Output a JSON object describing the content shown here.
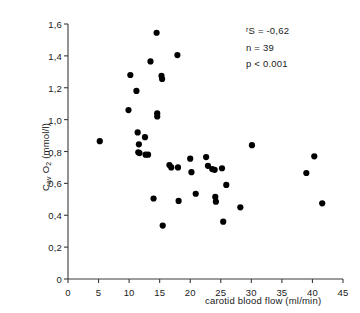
{
  "figure": {
    "background_color": "#ffffff",
    "marker_color": "#000000",
    "axis_color": "#3a3a3a"
  },
  "axes": {
    "x": {
      "label": "carotid blood flow (ml/min)",
      "min": 0,
      "max": 45,
      "ticks": [
        0,
        5,
        10,
        15,
        20,
        25,
        30,
        35,
        40,
        45
      ],
      "tick_labels": [
        "0",
        "5",
        "10",
        "15",
        "20",
        "25",
        "30",
        "35",
        "40",
        "45"
      ]
    },
    "y": {
      "label_text": "Cav O2 (mmol/l)",
      "label_main": "C",
      "label_sub1": "av",
      "label_o": " O",
      "label_sub2": "2",
      "label_units": " (mmol/l)",
      "min": 0,
      "max": 1.6,
      "ticks": [
        0,
        0.2,
        0.4,
        0.6,
        0.8,
        1.0,
        1.2,
        1.4,
        1.6
      ],
      "tick_labels": [
        "0",
        "0,2",
        "0,4",
        "0,6",
        "0,8",
        "1,0",
        "1,2",
        "1,4",
        "1,6"
      ]
    }
  },
  "annotations": {
    "correlation_prefix": "r",
    "correlation_subscript": "S",
    "correlation": "r S = -0,62",
    "correlation_value": " = -0,62",
    "sample_size": "n = 39",
    "p_value": "p < 0.001"
  },
  "chart_data": {
    "type": "scatter",
    "title": "",
    "xlabel": "carotid blood flow (ml/min)",
    "ylabel": "Cav O2 (mmol/l)",
    "xlim": [
      0,
      45
    ],
    "ylim": [
      0,
      1.6
    ],
    "grid": false,
    "legend": null,
    "n_points": 39,
    "statistics": {
      "spearman_rs": -0.62,
      "n": 39,
      "p": "< 0.001"
    },
    "points": [
      {
        "x": 5.2,
        "y": 0.865
      },
      {
        "x": 9.9,
        "y": 1.06
      },
      {
        "x": 10.2,
        "y": 1.28
      },
      {
        "x": 11.2,
        "y": 1.18
      },
      {
        "x": 11.4,
        "y": 0.92
      },
      {
        "x": 11.6,
        "y": 0.845
      },
      {
        "x": 11.5,
        "y": 0.795
      },
      {
        "x": 11.7,
        "y": 0.79
      },
      {
        "x": 12.6,
        "y": 0.89
      },
      {
        "x": 12.7,
        "y": 0.78
      },
      {
        "x": 13.1,
        "y": 0.78
      },
      {
        "x": 13.5,
        "y": 1.365
      },
      {
        "x": 14.0,
        "y": 0.505
      },
      {
        "x": 14.5,
        "y": 1.545
      },
      {
        "x": 14.6,
        "y": 1.04
      },
      {
        "x": 14.6,
        "y": 1.02
      },
      {
        "x": 15.3,
        "y": 1.275
      },
      {
        "x": 15.4,
        "y": 1.255
      },
      {
        "x": 15.5,
        "y": 0.335
      },
      {
        "x": 16.6,
        "y": 0.715
      },
      {
        "x": 16.9,
        "y": 0.7
      },
      {
        "x": 17.9,
        "y": 1.405
      },
      {
        "x": 18.0,
        "y": 0.7
      },
      {
        "x": 18.1,
        "y": 0.49
      },
      {
        "x": 20.0,
        "y": 0.755
      },
      {
        "x": 20.2,
        "y": 0.67
      },
      {
        "x": 20.9,
        "y": 0.535
      },
      {
        "x": 22.6,
        "y": 0.765
      },
      {
        "x": 22.9,
        "y": 0.71
      },
      {
        "x": 23.6,
        "y": 0.69
      },
      {
        "x": 24.0,
        "y": 0.685
      },
      {
        "x": 24.1,
        "y": 0.515
      },
      {
        "x": 24.2,
        "y": 0.485
      },
      {
        "x": 25.2,
        "y": 0.695
      },
      {
        "x": 25.4,
        "y": 0.36
      },
      {
        "x": 25.9,
        "y": 0.59
      },
      {
        "x": 28.2,
        "y": 0.45
      },
      {
        "x": 30.1,
        "y": 0.84
      },
      {
        "x": 39.0,
        "y": 0.665
      },
      {
        "x": 40.3,
        "y": 0.77
      },
      {
        "x": 41.6,
        "y": 0.475
      }
    ]
  }
}
